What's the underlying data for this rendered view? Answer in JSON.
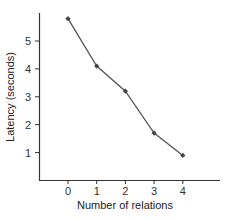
{
  "chart_data": {
    "type": "line",
    "title": "",
    "xlabel": "Number of relations",
    "ylabel": "Latency (seconds)",
    "x": [
      0,
      1,
      2,
      3,
      4
    ],
    "categories": [
      "0",
      "1",
      "2",
      "3",
      "4"
    ],
    "series": [
      {
        "name": "Latency",
        "values": [
          5.8,
          4.1,
          3.2,
          1.7,
          0.9
        ],
        "color": "#555555",
        "marker": "diamond"
      }
    ],
    "xticks": [
      0,
      1,
      2,
      3,
      4
    ],
    "yticks": [
      1,
      2,
      3,
      4,
      5
    ],
    "xlim": [
      -1,
      5.2
    ],
    "ylim": [
      0,
      5.95
    ],
    "grid": false,
    "legend": null
  },
  "axes": {
    "xlabel": "Number of relations",
    "ylabel": "Latency (seconds)",
    "xtick_labels": [
      "0",
      "1",
      "2",
      "3",
      "4"
    ],
    "ytick_labels": [
      "1",
      "2",
      "3",
      "4",
      "5"
    ]
  }
}
